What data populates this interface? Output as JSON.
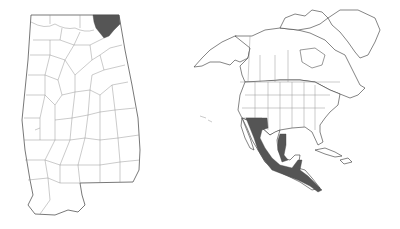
{
  "maps": [
    {
      "id": "alabama",
      "region": "Alabama counties",
      "highlighted_areas": [
        "northeast corner county (Jackson County)"
      ],
      "highlight_color": "#555555",
      "border_color": "#8a8a8a",
      "fill_color": "#ffffff"
    },
    {
      "id": "north-america",
      "region": "North America",
      "highlighted_areas": [
        "Arizona / New Mexico border region",
        "western Mexico (Sierra Madre Occidental)",
        "eastern Mexico (Sierra Madre Oriental)",
        "southern Mexico",
        "Central America to Panama"
      ],
      "highlight_color": "#555555",
      "border_color": "#8a8a8a",
      "fill_color": "#ffffff"
    }
  ],
  "labels": {
    "alabama": "Alabama county distribution map",
    "north_america": "North America range map"
  }
}
